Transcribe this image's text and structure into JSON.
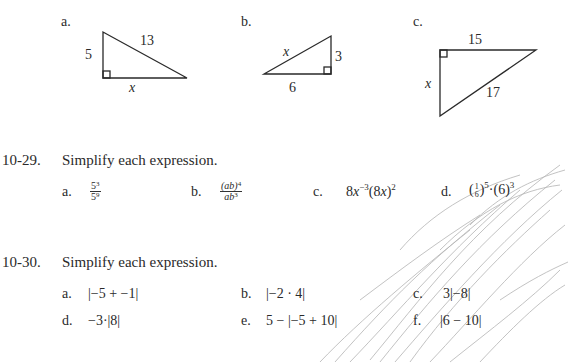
{
  "triangles": [
    {
      "label": "a.",
      "side_vertical": "5",
      "hypotenuse": "13",
      "side_horizontal": "x"
    },
    {
      "label": "b.",
      "hypotenuse": "x",
      "side_vertical": "3",
      "side_horizontal": "6"
    },
    {
      "label": "c.",
      "side_horizontal": "15",
      "side_vertical": "x",
      "hypotenuse": "17"
    }
  ],
  "problem_29": {
    "number": "10-29.",
    "prompt": "Simplify each expression.",
    "items": [
      {
        "label": "a.",
        "expr": "5^3 / 5^9"
      },
      {
        "label": "b.",
        "expr": "(ab)^4 / ab^3"
      },
      {
        "label": "c.",
        "expr": "8x^-3(8x)^2"
      },
      {
        "label": "d.",
        "expr": "(1/6)^5 · (6)^3"
      }
    ]
  },
  "problem_30": {
    "number": "10-30.",
    "prompt": "Simplify each expression.",
    "items": [
      {
        "label": "a.",
        "expr": "|−5 + −1|"
      },
      {
        "label": "b.",
        "expr": "|−2 · 4|"
      },
      {
        "label": "c.",
        "expr": "3|−8|"
      },
      {
        "label": "d.",
        "expr": "−3·|8|"
      },
      {
        "label": "e.",
        "expr": "5 − |−5 + 10|"
      },
      {
        "label": "f.",
        "expr": "|6 − 10|"
      }
    ]
  }
}
